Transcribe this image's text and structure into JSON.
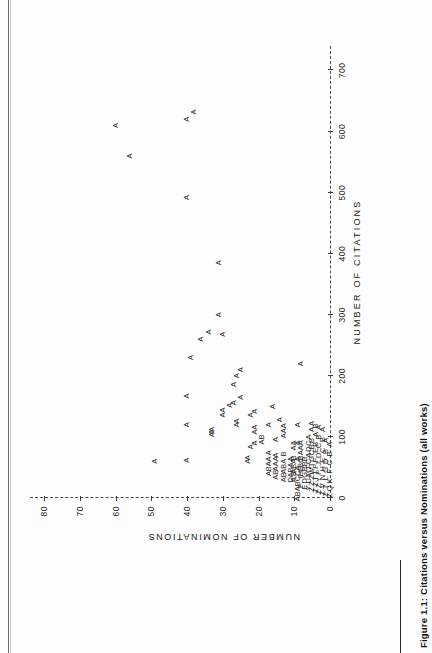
{
  "figure": {
    "caption": "Figure 1.1: Citations versus Nominations (all works)"
  },
  "chart_data": {
    "type": "scatter",
    "title": "",
    "xlabel": "NUMBER OF CITATIONS",
    "ylabel": "NUMBER OF NOMINATIONS",
    "xlim": [
      0,
      740
    ],
    "ylim": [
      0,
      84
    ],
    "xticks": [
      0,
      100,
      200,
      300,
      400,
      500,
      600,
      700
    ],
    "xticklabels": [
      "0",
      "100",
      "200",
      "300",
      "400",
      "500",
      "600",
      "700"
    ],
    "yticks": [
      0,
      10,
      20,
      30,
      40,
      50,
      60,
      70,
      80
    ],
    "yticklabels": [
      "0",
      "10",
      "20",
      "30",
      "40",
      "50",
      "60",
      "70",
      "80"
    ],
    "grid": false,
    "legend": null,
    "marker_note": "SAS-style overplot letters: A = 1 obs, B = 2 obs, C = 3 obs, D = 4 obs",
    "points": [
      {
        "x": 610,
        "y": 60,
        "label": "A"
      },
      {
        "x": 560,
        "y": 56,
        "label": "A"
      },
      {
        "x": 620,
        "y": 40,
        "label": "A"
      },
      {
        "x": 632,
        "y": 38,
        "label": "A"
      },
      {
        "x": 492,
        "y": 40,
        "label": "A"
      },
      {
        "x": 385,
        "y": 31,
        "label": "A"
      },
      {
        "x": 60,
        "y": 49,
        "label": "A"
      },
      {
        "x": 62,
        "y": 40,
        "label": "A"
      },
      {
        "x": 120,
        "y": 40,
        "label": "A"
      },
      {
        "x": 167,
        "y": 40,
        "label": "A"
      },
      {
        "x": 230,
        "y": 39,
        "label": "A"
      },
      {
        "x": 260,
        "y": 36,
        "label": "A"
      },
      {
        "x": 272,
        "y": 34,
        "label": "A"
      },
      {
        "x": 300,
        "y": 31,
        "label": "A"
      },
      {
        "x": 268,
        "y": 30,
        "label": "A"
      },
      {
        "x": 104,
        "y": 33,
        "label": "A"
      },
      {
        "x": 108,
        "y": 33,
        "label": "A"
      },
      {
        "x": 112,
        "y": 33,
        "label": "A"
      },
      {
        "x": 136,
        "y": 30,
        "label": "A"
      },
      {
        "x": 144,
        "y": 30,
        "label": "A"
      },
      {
        "x": 152,
        "y": 28,
        "label": "A"
      },
      {
        "x": 156,
        "y": 27,
        "label": "A"
      },
      {
        "x": 120,
        "y": 26,
        "label": "A"
      },
      {
        "x": 126,
        "y": 26,
        "label": "A"
      },
      {
        "x": 186,
        "y": 27,
        "label": "A"
      },
      {
        "x": 200,
        "y": 26,
        "label": "A"
      },
      {
        "x": 210,
        "y": 25,
        "label": "A"
      },
      {
        "x": 165,
        "y": 25,
        "label": "A"
      },
      {
        "x": 60,
        "y": 23,
        "label": "A"
      },
      {
        "x": 66,
        "y": 23,
        "label": "A"
      },
      {
        "x": 84,
        "y": 22,
        "label": "A"
      },
      {
        "x": 90,
        "y": 21,
        "label": "A"
      },
      {
        "x": 108,
        "y": 21,
        "label": "A"
      },
      {
        "x": 116,
        "y": 21,
        "label": "A"
      },
      {
        "x": 136,
        "y": 22,
        "label": "A"
      },
      {
        "x": 142,
        "y": 21,
        "label": "A"
      },
      {
        "x": 96,
        "y": 19,
        "label": "AB"
      },
      {
        "x": 40,
        "y": 17,
        "label": "A"
      },
      {
        "x": 48,
        "y": 17,
        "label": "B"
      },
      {
        "x": 56,
        "y": 17,
        "label": "A"
      },
      {
        "x": 64,
        "y": 17,
        "label": "A"
      },
      {
        "x": 74,
        "y": 17,
        "label": "A"
      },
      {
        "x": 120,
        "y": 17,
        "label": "A"
      },
      {
        "x": 150,
        "y": 16,
        "label": "A"
      },
      {
        "x": 38,
        "y": 15,
        "label": "AB"
      },
      {
        "x": 56,
        "y": 15,
        "label": "AAA"
      },
      {
        "x": 70,
        "y": 15,
        "label": "A"
      },
      {
        "x": 96,
        "y": 15,
        "label": "A"
      },
      {
        "x": 128,
        "y": 14,
        "label": "A"
      },
      {
        "x": 34,
        "y": 13,
        "label": "AB"
      },
      {
        "x": 52,
        "y": 13,
        "label": "ABA"
      },
      {
        "x": 72,
        "y": 13,
        "label": "B"
      },
      {
        "x": 110,
        "y": 13,
        "label": "AAA"
      },
      {
        "x": 30,
        "y": 11,
        "label": "D"
      },
      {
        "x": 46,
        "y": 11,
        "label": "ABA"
      },
      {
        "x": 64,
        "y": 11,
        "label": "A"
      },
      {
        "x": 30,
        "y": 10,
        "label": "A"
      },
      {
        "x": 40,
        "y": 10,
        "label": "B"
      },
      {
        "x": 52,
        "y": 10,
        "label": "ABA"
      },
      {
        "x": 66,
        "y": 10,
        "label": "B"
      },
      {
        "x": 86,
        "y": 10,
        "label": "AA"
      },
      {
        "x": 24,
        "y": 9,
        "label": "ABABCCA"
      },
      {
        "x": 64,
        "y": 9,
        "label": "A"
      },
      {
        "x": 90,
        "y": 9,
        "label": "A"
      },
      {
        "x": 120,
        "y": 9,
        "label": "A"
      },
      {
        "x": 20,
        "y": 8,
        "label": "F"
      },
      {
        "x": 34,
        "y": 8,
        "label": "I"
      },
      {
        "x": 44,
        "y": 8,
        "label": "HE"
      },
      {
        "x": 58,
        "y": 8,
        "label": "BC"
      },
      {
        "x": 78,
        "y": 8,
        "label": "BAAA"
      },
      {
        "x": 220,
        "y": 8,
        "label": "A"
      },
      {
        "x": 18,
        "y": 7,
        "label": "E"
      },
      {
        "x": 28,
        "y": 7,
        "label": "D"
      },
      {
        "x": 38,
        "y": 7,
        "label": "G"
      },
      {
        "x": 48,
        "y": 7,
        "label": "B"
      },
      {
        "x": 60,
        "y": 7,
        "label": "BB"
      },
      {
        "x": 16,
        "y": 6,
        "label": "Y"
      },
      {
        "x": 28,
        "y": 6,
        "label": "U"
      },
      {
        "x": 40,
        "y": 6,
        "label": "M"
      },
      {
        "x": 50,
        "y": 6,
        "label": "T"
      },
      {
        "x": 60,
        "y": 6,
        "label": "C"
      },
      {
        "x": 70,
        "y": 6,
        "label": "A"
      },
      {
        "x": 80,
        "y": 6,
        "label": "D"
      },
      {
        "x": 90,
        "y": 6,
        "label": "C"
      },
      {
        "x": 100,
        "y": 6,
        "label": "A"
      },
      {
        "x": 14,
        "y": 5,
        "label": "Z"
      },
      {
        "x": 24,
        "y": 5,
        "label": "Z"
      },
      {
        "x": 34,
        "y": 5,
        "label": "Z"
      },
      {
        "x": 44,
        "y": 5,
        "label": "W"
      },
      {
        "x": 54,
        "y": 5,
        "label": "T"
      },
      {
        "x": 64,
        "y": 5,
        "label": "G"
      },
      {
        "x": 74,
        "y": 5,
        "label": "C"
      },
      {
        "x": 84,
        "y": 5,
        "label": "B"
      },
      {
        "x": 94,
        "y": 5,
        "label": "B"
      },
      {
        "x": 112,
        "y": 5,
        "label": "A"
      },
      {
        "x": 122,
        "y": 5,
        "label": "A"
      },
      {
        "x": 12,
        "y": 4,
        "label": "Z"
      },
      {
        "x": 22,
        "y": 4,
        "label": "Z"
      },
      {
        "x": 32,
        "y": 4,
        "label": "T"
      },
      {
        "x": 42,
        "y": 4,
        "label": "T"
      },
      {
        "x": 52,
        "y": 4,
        "label": "P"
      },
      {
        "x": 62,
        "y": 4,
        "label": "F"
      },
      {
        "x": 78,
        "y": 4,
        "label": "E"
      },
      {
        "x": 88,
        "y": 4,
        "label": "B"
      },
      {
        "x": 104,
        "y": 4,
        "label": "A"
      },
      {
        "x": 118,
        "y": 4,
        "label": "B"
      },
      {
        "x": 10,
        "y": 3,
        "label": "Z"
      },
      {
        "x": 20,
        "y": 3,
        "label": "Z"
      },
      {
        "x": 30,
        "y": 3,
        "label": "Y"
      },
      {
        "x": 42,
        "y": 3,
        "label": "P"
      },
      {
        "x": 56,
        "y": 3,
        "label": "J"
      },
      {
        "x": 70,
        "y": 3,
        "label": "D"
      },
      {
        "x": 86,
        "y": 3,
        "label": "C"
      },
      {
        "x": 100,
        "y": 3,
        "label": "B"
      },
      {
        "x": 116,
        "y": 3,
        "label": "A"
      },
      {
        "x": 8,
        "y": 2,
        "label": "Z"
      },
      {
        "x": 20,
        "y": 2,
        "label": "V"
      },
      {
        "x": 34,
        "y": 2,
        "label": "N"
      },
      {
        "x": 48,
        "y": 2,
        "label": "H"
      },
      {
        "x": 62,
        "y": 2,
        "label": "E"
      },
      {
        "x": 78,
        "y": 2,
        "label": "C"
      },
      {
        "x": 96,
        "y": 2,
        "label": "B"
      },
      {
        "x": 112,
        "y": 2,
        "label": "A"
      },
      {
        "x": 6,
        "y": 1,
        "label": "Z"
      },
      {
        "x": 18,
        "y": 1,
        "label": "T"
      },
      {
        "x": 32,
        "y": 1,
        "label": "L"
      },
      {
        "x": 46,
        "y": 1,
        "label": "G"
      },
      {
        "x": 60,
        "y": 1,
        "label": "D"
      },
      {
        "x": 76,
        "y": 1,
        "label": "B"
      },
      {
        "x": 94,
        "y": 1,
        "label": "A"
      },
      {
        "x": 4,
        "y": 0,
        "label": "Z"
      },
      {
        "x": 16,
        "y": 0,
        "label": "Q"
      },
      {
        "x": 28,
        "y": 0,
        "label": "K"
      },
      {
        "x": 44,
        "y": 0,
        "label": "F"
      },
      {
        "x": 58,
        "y": 0,
        "label": "C"
      },
      {
        "x": 72,
        "y": 0,
        "label": "B"
      },
      {
        "x": 88,
        "y": 0,
        "label": "A"
      }
    ]
  }
}
